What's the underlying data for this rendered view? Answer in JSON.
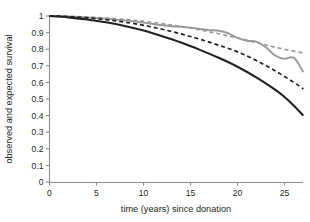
{
  "chart_data": {
    "type": "line",
    "title": "",
    "xlabel": "time (years) since donation",
    "ylabel": "observed and expected survival",
    "xlim": [
      0,
      28
    ],
    "ylim": [
      0,
      1
    ],
    "grid": false,
    "legend": "none",
    "xticks": [
      "0",
      "5",
      "10",
      "15",
      "20",
      "25"
    ],
    "xtick_values": [
      0,
      5,
      10,
      15,
      20,
      25
    ],
    "yticks": [
      "0",
      "0.1",
      "0.2",
      "0.3",
      "0.4",
      "0.5",
      "0.6",
      "0.7",
      "0.8",
      "0.9",
      "1"
    ],
    "ytick_values": [
      0,
      0.1,
      0.2,
      0.3,
      0.4,
      0.5,
      0.6,
      0.7,
      0.8,
      0.9,
      1.0
    ],
    "series": [
      {
        "name": "expected survival (upper)",
        "style": "dashed",
        "color": "#9a9a9a",
        "width": 1.7,
        "dash": "4,3",
        "x": [
          0,
          2,
          4,
          6,
          8,
          10,
          12,
          14,
          16,
          18,
          20,
          22,
          24,
          26,
          27
        ],
        "values": [
          1.0,
          0.998,
          0.994,
          0.988,
          0.979,
          0.968,
          0.953,
          0.936,
          0.916,
          0.893,
          0.868,
          0.84,
          0.812,
          0.788,
          0.778
        ]
      },
      {
        "name": "observed survival (upper)",
        "style": "solid",
        "color": "#9a9a9a",
        "width": 1.9,
        "dash": "none",
        "x": [
          0,
          2,
          4,
          6,
          8,
          10,
          11,
          12,
          13,
          14,
          15,
          16,
          17,
          18,
          19,
          20,
          21,
          22,
          23,
          24,
          25,
          26,
          27
        ],
        "values": [
          1.0,
          0.997,
          0.992,
          0.984,
          0.974,
          0.96,
          0.952,
          0.944,
          0.938,
          0.935,
          0.93,
          0.922,
          0.915,
          0.911,
          0.896,
          0.868,
          0.851,
          0.846,
          0.812,
          0.762,
          0.742,
          0.748,
          0.662
        ]
      },
      {
        "name": "expected survival (lower)",
        "style": "dashed",
        "color": "#231f20",
        "width": 1.7,
        "dash": "4,3",
        "x": [
          0,
          2,
          4,
          6,
          8,
          10,
          12,
          14,
          16,
          18,
          20,
          22,
          24,
          26,
          27
        ],
        "values": [
          1.0,
          0.996,
          0.989,
          0.978,
          0.963,
          0.944,
          0.92,
          0.892,
          0.86,
          0.824,
          0.784,
          0.732,
          0.67,
          0.6,
          0.56
        ]
      },
      {
        "name": "observed survival (lower)",
        "style": "solid",
        "color": "#231f20",
        "width": 2.1,
        "dash": "none",
        "x": [
          0,
          2,
          4,
          6,
          8,
          10,
          12,
          14,
          16,
          18,
          20,
          22,
          24,
          25,
          26,
          27
        ],
        "values": [
          1.0,
          0.992,
          0.979,
          0.962,
          0.94,
          0.912,
          0.878,
          0.84,
          0.796,
          0.748,
          0.694,
          0.63,
          0.556,
          0.512,
          0.46,
          0.4
        ]
      }
    ]
  }
}
